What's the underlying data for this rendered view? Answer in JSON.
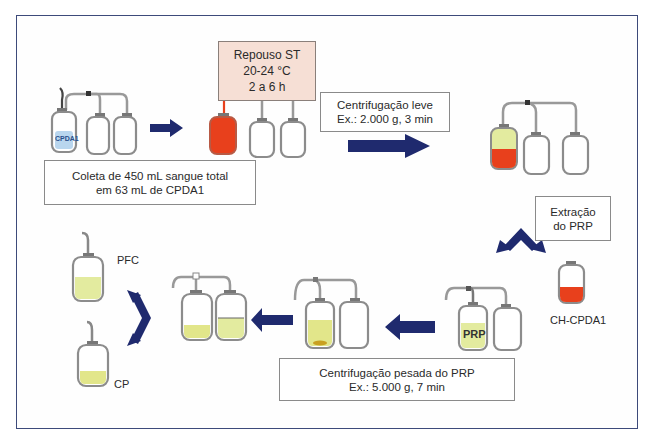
{
  "diagram": {
    "colors": {
      "frame_border": "#3d4a7a",
      "arrow": "#1f2a6e",
      "whole_blood": "#e8401c",
      "plasma": "#e3eb9f",
      "anticoagulant": "#b9d6ee",
      "bag_outline": "#8c8c8c",
      "rest_box_fill": "#f6dfd5",
      "buffy_coat": "#c9a020"
    },
    "steps": {
      "collection": {
        "line1": "Coleta de 450 mL sangue total",
        "line2": "em 63 mL de CPDA1",
        "bag_label": "CPDA1"
      },
      "rest": {
        "line1": "Repouso ST",
        "line2": "20-24 °C",
        "line3": "2 a 6 h"
      },
      "light_spin": {
        "line1": "Centrifugação leve",
        "line2": "Ex.: 2.000 g, 3 min"
      },
      "extraction": {
        "line1": "Extração",
        "line2": "do PRP"
      },
      "heavy_spin": {
        "line1": "Centrifugação pesada do PRP",
        "line2": "Ex.: 5.000 g, 7 min"
      }
    },
    "products": {
      "red_cells": "CH-CPDA1",
      "prp": "PRP",
      "plasma": "PFC",
      "platelets": "CP"
    },
    "nodes": [
      {
        "id": "collection-bags",
        "label": "CPDA1"
      },
      {
        "id": "rest-bags",
        "label": "Repouso ST"
      },
      {
        "id": "separated-bags",
        "label": "Centrifugação leve"
      },
      {
        "id": "red-cell-bag",
        "label": "CH-CPDA1"
      },
      {
        "id": "prp-bags",
        "label": "PRP"
      },
      {
        "id": "heavy-spun-bags",
        "label": "Centrifugação pesada do PRP"
      },
      {
        "id": "split-bags",
        "label": ""
      },
      {
        "id": "plasma-bag",
        "label": "PFC"
      },
      {
        "id": "platelet-bag",
        "label": "CP"
      }
    ],
    "edges": [
      {
        "from": "collection-bags",
        "to": "rest-bags"
      },
      {
        "from": "rest-bags",
        "to": "separated-bags"
      },
      {
        "from": "separated-bags",
        "to": "red-cell-bag",
        "label": "Extração do PRP"
      },
      {
        "from": "separated-bags",
        "to": "prp-bags",
        "label": "Extração do PRP"
      },
      {
        "from": "prp-bags",
        "to": "heavy-spun-bags"
      },
      {
        "from": "heavy-spun-bags",
        "to": "split-bags"
      },
      {
        "from": "split-bags",
        "to": "plasma-bag"
      },
      {
        "from": "split-bags",
        "to": "platelet-bag"
      }
    ]
  }
}
